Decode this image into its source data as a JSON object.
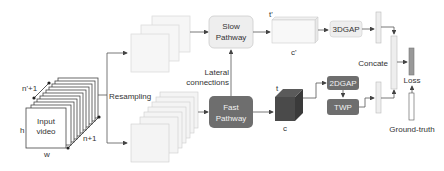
{
  "diagram": {
    "input": {
      "line1": "Input",
      "line2": "video",
      "h_label": "h",
      "w_label": "w",
      "n_label": "n+1",
      "n_prime_label": "n'+1"
    },
    "resampling_label": "Resampling",
    "slow_pathway": {
      "line1": "Slow",
      "line2": "Pathway"
    },
    "fast_pathway": {
      "line1": "Fast",
      "line2": "Pathway"
    },
    "lateral": {
      "line1": "Lateral",
      "line2": "connections"
    },
    "slow_feature": {
      "t_label": "t'",
      "c_label": "c'"
    },
    "fast_feature": {
      "t_label": "t",
      "c_label": "c"
    },
    "gap3d_label": "3DGAP",
    "gap2d_label": "2DGAP",
    "twp_label": "TWP",
    "concate_label": "Concate",
    "loss_label": "Loss",
    "ground_truth_label": "Ground-truth",
    "colors": {
      "dark_block": "#6e6e6e",
      "light_block": "#eeeeee",
      "line": "#555555"
    }
  }
}
